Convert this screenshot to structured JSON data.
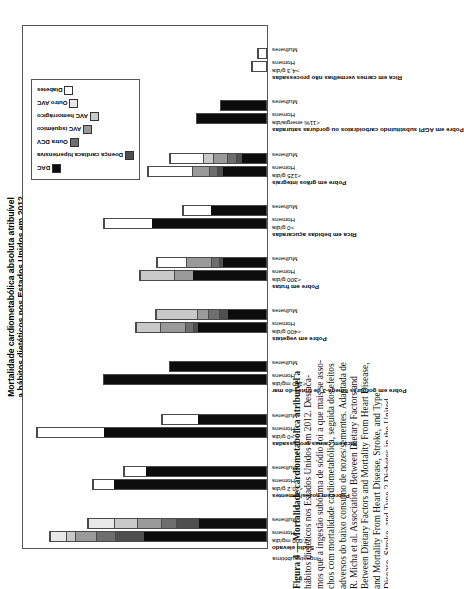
{
  "figure": {
    "axis_title_line1": "Mortalidade cardiometabólica absoluta atribuível",
    "axis_title_line2": "a hábitos dietéticos nos Estados Unidos em 2012",
    "caption_lines": [
      "Figura 4 — Mortalidade cardiometabólica atribuível a",
      "hábitos dietéticos nos Estados Unidos em 2012. Destaca-",
      "mos que a ingestão subótima de sódio foi a que mais se asso-",
      "chos com mortalidade cardiometabólica, seguida dos efeitos",
      "adversos do baixo consumo de nozes/sementes. Adaptada de",
      "R. Micha et al. Association Between Dietary Factors and",
      "Between Dietary Factors and Mortality From Heart Disease,",
      "and Mortality From Heart Disease, Stroke, and Type",
      "Disease, Stroke, and Type 2 Diabetes in the United",
      "2 Diabetes in the United States. JAMA. 2017;",
      "States. JAMA. 2017; 317(9):912-924. DCV: doença car-",
      "317(9):912-924. DCV: doença cardiovascular; DAC: doença",
      "dos graves; DAC: doença arterial coronariana;",
      "AVC: acidente vascular cerebral.",
      "rebral."
    ],
    "subtitle_tick": {
      "line1": "Ingesta",
      "line2": "subótima"
    }
  },
  "chart_data": {
    "type": "bar",
    "orientation": "vertical-stacked",
    "title": "Mortalidade cardiometabólica absoluta atribuível a hábitos dietéticos nos Estados Unidos em 2012",
    "xlabel": "",
    "ylabel": "Mortalidade cardiometabólica absoluta atribuível a hábitos dietéticos nos Estados Unidos em 2012",
    "grid": false,
    "legend_position": "top-right",
    "series": [
      {
        "name": "DAC",
        "color": "#0c0c0c"
      },
      {
        "name": "Doença cardíaca hipertensiva",
        "color": "#4f4f4f"
      },
      {
        "name": "Outra DCV",
        "color": "#6e6e6e"
      },
      {
        "name": "AVC isquêmico",
        "color": "#9a9a9a"
      },
      {
        "name": "AVC hemorrágico",
        "color": "#c9c9c9"
      },
      {
        "name": "Outro AVC",
        "color": "#e8e8e8"
      },
      {
        "name": "Diabetes",
        "color": "#ffffff"
      }
    ],
    "groups": [
      {
        "label": "Sódio elevado",
        "cutoff": ">2.000 mg/dia",
        "bars": [
          {
            "sex": "Homens",
            "values": [
              38.5,
              9.0,
              6.0,
              6.5,
              3.0,
              5.0,
              0.0
            ],
            "total": 68.0
          },
          {
            "sex": "Mulheres",
            "values": [
              21.0,
              7.5,
              4.5,
              7.5,
              7.5,
              8.0,
              0.0
            ],
            "total": 56.0
          }
        ]
      },
      {
        "label": "Pobre em nozes/sementes",
        "cutoff": "<20,2 g/dia",
        "bars": [
          {
            "sex": "Homens",
            "values": [
              48.0,
              0.0,
              0.0,
              0.0,
              0.0,
              0.0,
              6.5
            ],
            "total": 54.5
          },
          {
            "sex": "Mulheres",
            "values": [
              38.0,
              0.0,
              0.0,
              0.0,
              0.0,
              0.0,
              7.0
            ],
            "total": 45.0
          }
        ]
      },
      {
        "label": "Rica em carnes processadas",
        "cutoff": ">0 g/dia",
        "bars": [
          {
            "sex": "Homens",
            "values": [
              51.0,
              0.0,
              0.0,
              0.0,
              0.0,
              0.0,
              21.0
            ],
            "total": 72.0
          },
          {
            "sex": "Mulheres",
            "values": [
              21.5,
              0.0,
              0.0,
              0.0,
              0.0,
              0.0,
              11.5
            ],
            "total": 33.0
          }
        ]
      },
      {
        "label": "Pobre em gorduras ômega-3 de frutos do mar",
        "cutoff": "<250 mg/dia",
        "bars": [
          {
            "sex": "Homens",
            "values": [
              51.0,
              0.0,
              0.0,
              0.0,
              0.0,
              0.0,
              0.0
            ],
            "total": 51.0
          },
          {
            "sex": "Mulheres",
            "values": [
              30.5,
              0.0,
              0.0,
              0.0,
              0.0,
              0.0,
              0.0
            ],
            "total": 30.5
          }
        ]
      },
      {
        "label": "Pobre em vegetais",
        "cutoff": "<400 g/dia",
        "bars": [
          {
            "sex": "Homens",
            "values": [
              21.5,
              1.5,
              2.5,
              8.0,
              7.5,
              0.0,
              0.0
            ],
            "total": 41.0
          },
          {
            "sex": "Mulheres",
            "values": [
              12.0,
              3.0,
              3.5,
              3.5,
              13.0,
              0.0,
              0.0
            ],
            "total": 35.0
          }
        ]
      },
      {
        "label": "Pobre em frutas",
        "cutoff": "<300 g/dia",
        "bars": [
          {
            "sex": "Homens",
            "values": [
              23.0,
              0.0,
              0.0,
              6.0,
              11.0,
              0.0,
              0.0
            ],
            "total": 40.0
          },
          {
            "sex": "Mulheres",
            "values": [
              13.5,
              1.5,
              2.5,
              8.0,
              0.0,
              0.0,
              9.0
            ],
            "total": 34.5
          }
        ]
      },
      {
        "label": "Rica em bebidas açucaradas",
        "cutoff": ">0 g/dia",
        "bars": [
          {
            "sex": "Homens",
            "values": [
              36.0,
              0.0,
              0.0,
              0.0,
              0.0,
              0.0,
              15.0
            ],
            "total": 51.0
          },
          {
            "sex": "Mulheres",
            "values": [
              17.5,
              0.0,
              0.0,
              0.0,
              0.0,
              0.0,
              9.0
            ],
            "total": 26.5
          }
        ]
      },
      {
        "label": "Pobre em grãos integrais",
        "cutoff": "<125 g/dia",
        "bars": [
          {
            "sex": "Homens",
            "values": [
              13.5,
              2.0,
              2.5,
              5.5,
              0.0,
              0.0,
              14.0
            ],
            "total": 37.5
          },
          {
            "sex": "Mulheres",
            "values": [
              7.5,
              2.0,
              3.0,
              4.5,
              3.0,
              0.0,
              10.5
            ],
            "total": 30.5
          }
        ]
      },
      {
        "label": "Pobre em AGPI substituindo carboidratos ou gorduras saturadas",
        "cutoff": "<11% energia/dia",
        "bars": [
          {
            "sex": "Homens",
            "values": [
              22.0,
              0.0,
              0.0,
              0.0,
              0.0,
              0.0,
              0.0
            ],
            "total": 22.0
          },
          {
            "sex": "Mulheres",
            "values": [
              14.5,
              0.0,
              0.0,
              0.0,
              0.0,
              0.0,
              0.0
            ],
            "total": 14.5
          }
        ]
      },
      {
        "label": "Rica em carnes vermelhas não processadas",
        "cutoff": ">4,3 g/dia",
        "bars": [
          {
            "sex": "Homens",
            "values": [
              0.0,
              0.0,
              0.0,
              0.0,
              0.0,
              0.0,
              5.0
            ],
            "total": 5.0
          },
          {
            "sex": "Mulheres",
            "values": [
              0.0,
              0.0,
              0.0,
              0.0,
              0.0,
              0.0,
              3.0
            ],
            "total": 3.0
          }
        ]
      }
    ],
    "ymax": 76
  }
}
